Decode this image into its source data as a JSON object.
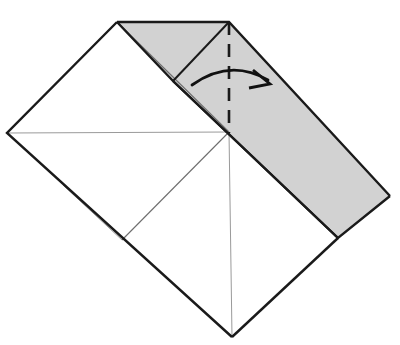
{
  "diagram": {
    "type": "origami-fold-instruction",
    "canvas": {
      "width": 400,
      "height": 345,
      "background": "#ffffff"
    },
    "colors": {
      "paper_front": "#ffffff",
      "paper_back_shaded": "#d2d2d2",
      "outline": "#1a1a1a",
      "crease_faint": "#9a9a9a",
      "fold_line": "#1a1a1a",
      "arrow": "#111111"
    },
    "vertices": {
      "top_left_corner": "117,22",
      "top_apex": "229,22",
      "left_apex": "7,133",
      "bottom_apex": "232,337",
      "flap_far_corner": "390,196",
      "flap_bottom_corner": "338,238",
      "center": "229,132",
      "flap_inner_corner": "173,81",
      "left_mid_crease": "122,240"
    },
    "shapes": {
      "base_sheet_points": "117,22 229,22 338,238 232,337 7,133",
      "shaded_flap_points": "117,22 229,22 390,196 338,238 173,81",
      "shaded_flap_label": "folded-flap-colored-side"
    },
    "outlines": {
      "base_left_edge": "117,22 7,133 232,337",
      "base_right_edge": "232,337 338,238",
      "flap_top_edge": "117,22 229,22 390,196",
      "flap_bottom_edge": "390,196 338,238 173,81 117,22",
      "flap_inner_edge": "229,22 173,81",
      "flap_diagonal_edge": "173,81 338,238"
    },
    "creases": [
      {
        "name": "horizontal-crease",
        "path": "7,133 229,132"
      },
      {
        "name": "vertical-crease",
        "path": "229,132 232,337"
      },
      {
        "name": "diagonal-crease-down-left",
        "path": "229,132 122,240"
      },
      {
        "name": "diagonal-crease-up-left",
        "path": "117,22 229,132"
      },
      {
        "name": "diagonal-crease-lower-left",
        "path": "122,240 63,185"
      }
    ],
    "fold_line": {
      "name": "valley-fold-dashed-line",
      "x": 229,
      "y_start": 22,
      "y_end": 133,
      "dash": "13 9"
    },
    "arrow": {
      "name": "fold-direction-arrow",
      "description": "curved arrow indicating fold to the right",
      "arc_path": "M 192 85 Q 230 58 268 80",
      "head_path": "M 253 70 L 270 84 L 249 88",
      "direction": "right"
    },
    "labels": {
      "step_number": "",
      "caption": ""
    }
  }
}
